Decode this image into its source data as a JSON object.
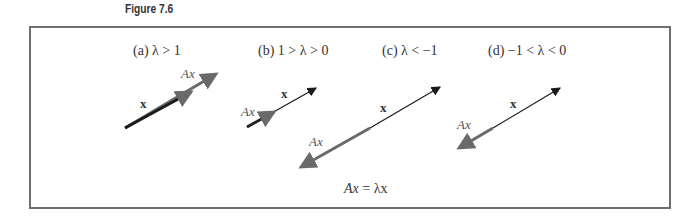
{
  "figure": {
    "title": "Figure 7.6",
    "equation": {
      "lhs": "Ax",
      "eq": "=",
      "rhs": "λx"
    },
    "colors": {
      "x_vector": "#222222",
      "Ax_vector": "#6a6a6a",
      "frame": "#6e6e6e"
    },
    "panels": [
      {
        "id": "a",
        "caption": "(a)  λ > 1",
        "x_label": "x",
        "Ax_label": "Ax"
      },
      {
        "id": "b",
        "caption": "(b)  1 > λ > 0",
        "x_label": "x",
        "Ax_label": "Ax"
      },
      {
        "id": "c",
        "caption": "(c)  λ < −1",
        "x_label": "x",
        "Ax_label": "Ax"
      },
      {
        "id": "d",
        "caption": "(d)  −1 < λ < 0",
        "x_label": "x",
        "Ax_label": "Ax"
      }
    ]
  }
}
